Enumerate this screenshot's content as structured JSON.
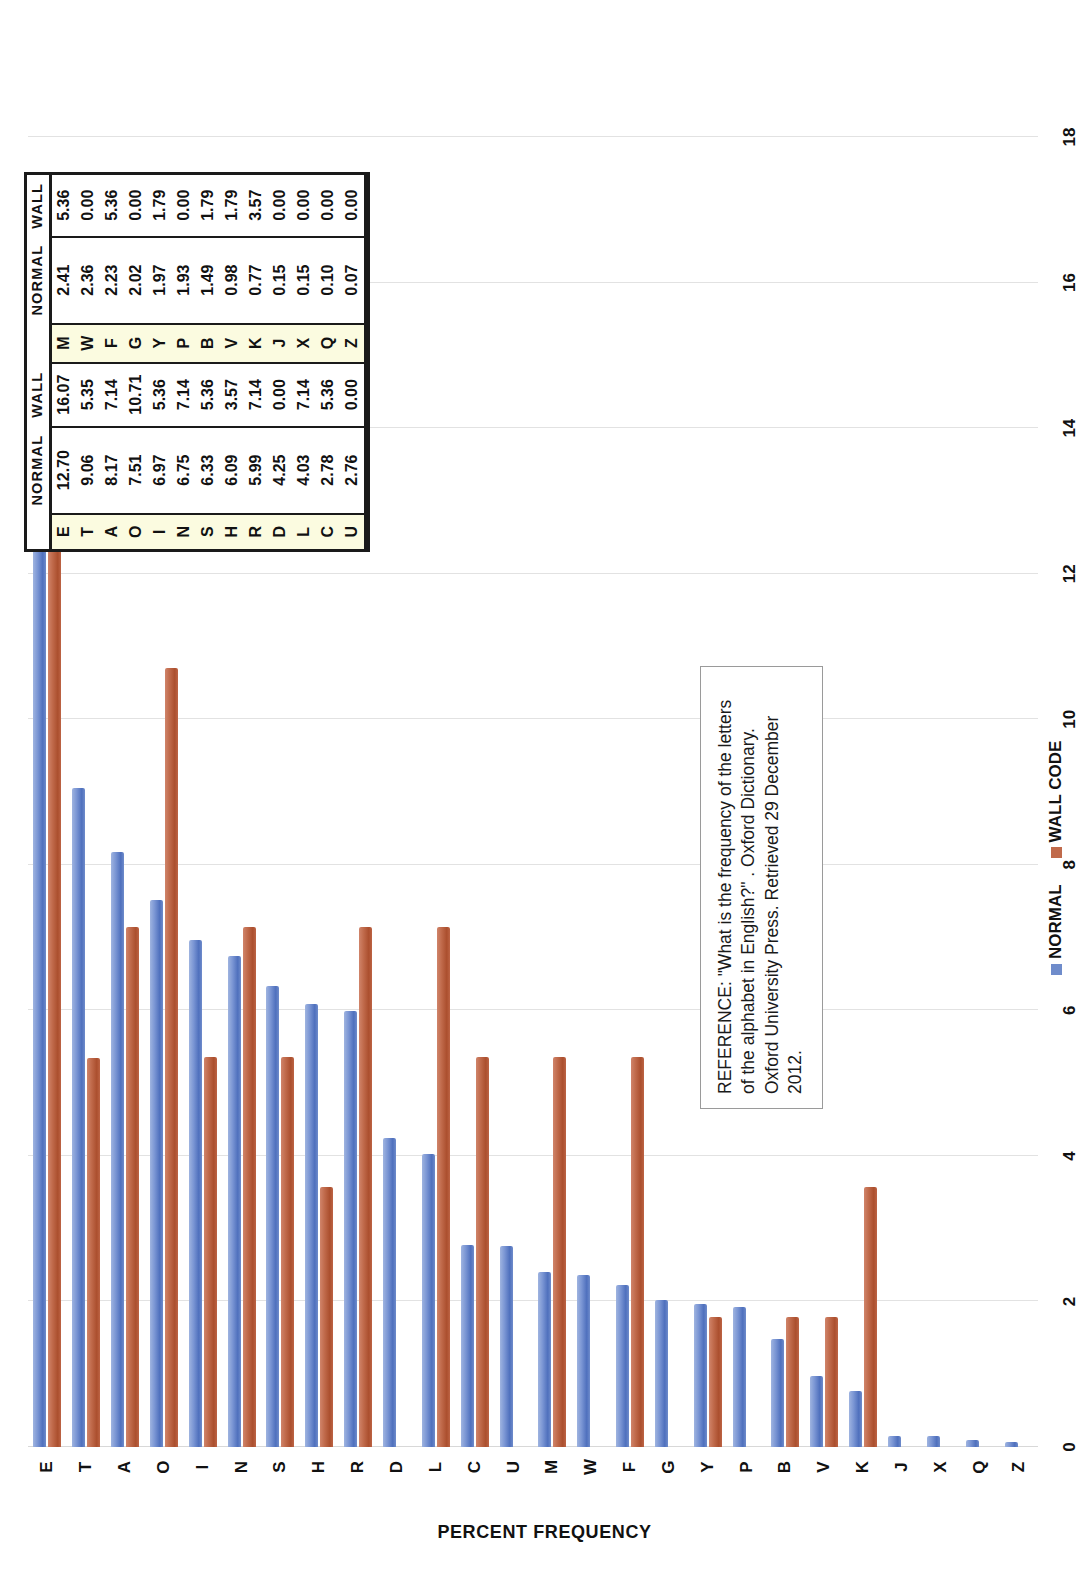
{
  "chart_data": {
    "type": "bar",
    "title": "",
    "xlabel": "",
    "ylabel": "PERCENT FREQUENCY",
    "orientation": "horizontal",
    "ylim": [
      0,
      18
    ],
    "tick_labels": [
      "0",
      "2",
      "4",
      "6",
      "8",
      "10",
      "12",
      "14",
      "16",
      "18"
    ],
    "ticks": [
      0,
      2,
      4,
      6,
      8,
      10,
      12,
      14,
      16,
      18
    ],
    "grid": true,
    "legend_position": "bottom",
    "categories": [
      "E",
      "T",
      "A",
      "O",
      "I",
      "N",
      "S",
      "H",
      "R",
      "D",
      "L",
      "C",
      "U",
      "M",
      "W",
      "F",
      "G",
      "Y",
      "P",
      "B",
      "V",
      "K",
      "J",
      "X",
      "Q",
      "Z"
    ],
    "series": [
      {
        "name": "NORMAL",
        "color": "#6f8ccb",
        "values": [
          12.7,
          9.06,
          8.17,
          7.51,
          6.97,
          6.75,
          6.33,
          6.09,
          5.99,
          4.25,
          4.03,
          2.78,
          2.76,
          2.41,
          2.36,
          2.23,
          2.02,
          1.97,
          1.93,
          1.49,
          0.98,
          0.77,
          0.15,
          0.15,
          0.1,
          0.07
        ]
      },
      {
        "name": "WALL CODE",
        "color": "#c06a4b",
        "values": [
          16.07,
          5.35,
          7.14,
          10.71,
          5.36,
          7.14,
          5.36,
          3.57,
          7.14,
          0.0,
          7.14,
          5.36,
          0.0,
          5.36,
          0.0,
          5.36,
          0.0,
          1.79,
          0.0,
          1.79,
          1.79,
          3.57,
          0.0,
          0.0,
          0.0,
          0.0
        ]
      }
    ]
  },
  "legend": {
    "items": [
      {
        "label": "NORMAL",
        "color": "#6f8ccb"
      },
      {
        "label": "WALL CODE",
        "color": "#c06a4b"
      }
    ]
  },
  "reference": {
    "text": "REFERENCE: \"What is the frequency of the letters of the alphabet in English?\" . Oxford Dictionary. Oxford University Press. Retrieved 29 December 2012."
  },
  "table": {
    "headers": [
      "",
      "NORMAL",
      "WALL",
      "",
      "NORMAL",
      "WALL"
    ],
    "header_left_normal": "NORMAL",
    "header_left_wall": "WALL",
    "header_right_normal": "NORMAL",
    "header_right_wall": "WALL",
    "rows": [
      {
        "left_letter": "E",
        "left_normal": "12.70",
        "left_wall": "16.07",
        "right_letter": "M",
        "right_normal": "2.41",
        "right_wall": "5.36"
      },
      {
        "left_letter": "T",
        "left_normal": "9.06",
        "left_wall": "5.35",
        "right_letter": "W",
        "right_normal": "2.36",
        "right_wall": "0.00"
      },
      {
        "left_letter": "A",
        "left_normal": "8.17",
        "left_wall": "7.14",
        "right_letter": "F",
        "right_normal": "2.23",
        "right_wall": "5.36"
      },
      {
        "left_letter": "O",
        "left_normal": "7.51",
        "left_wall": "10.71",
        "right_letter": "G",
        "right_normal": "2.02",
        "right_wall": "0.00"
      },
      {
        "left_letter": "I",
        "left_normal": "6.97",
        "left_wall": "5.36",
        "right_letter": "Y",
        "right_normal": "1.97",
        "right_wall": "1.79"
      },
      {
        "left_letter": "N",
        "left_normal": "6.75",
        "left_wall": "7.14",
        "right_letter": "P",
        "right_normal": "1.93",
        "right_wall": "0.00"
      },
      {
        "left_letter": "S",
        "left_normal": "6.33",
        "left_wall": "5.36",
        "right_letter": "B",
        "right_normal": "1.49",
        "right_wall": "1.79"
      },
      {
        "left_letter": "H",
        "left_normal": "6.09",
        "left_wall": "3.57",
        "right_letter": "V",
        "right_normal": "0.98",
        "right_wall": "1.79"
      },
      {
        "left_letter": "R",
        "left_normal": "5.99",
        "left_wall": "7.14",
        "right_letter": "K",
        "right_normal": "0.77",
        "right_wall": "3.57"
      },
      {
        "left_letter": "D",
        "left_normal": "4.25",
        "left_wall": "0.00",
        "right_letter": "J",
        "right_normal": "0.15",
        "right_wall": "0.00"
      },
      {
        "left_letter": "L",
        "left_normal": "4.03",
        "left_wall": "7.14",
        "right_letter": "X",
        "right_normal": "0.15",
        "right_wall": "0.00"
      },
      {
        "left_letter": "C",
        "left_normal": "2.78",
        "left_wall": "5.36",
        "right_letter": "Q",
        "right_normal": "0.10",
        "right_wall": "0.00"
      },
      {
        "left_letter": "U",
        "left_normal": "2.76",
        "left_wall": "0.00",
        "right_letter": "Z",
        "right_normal": "0.07",
        "right_wall": "0.00"
      }
    ]
  }
}
